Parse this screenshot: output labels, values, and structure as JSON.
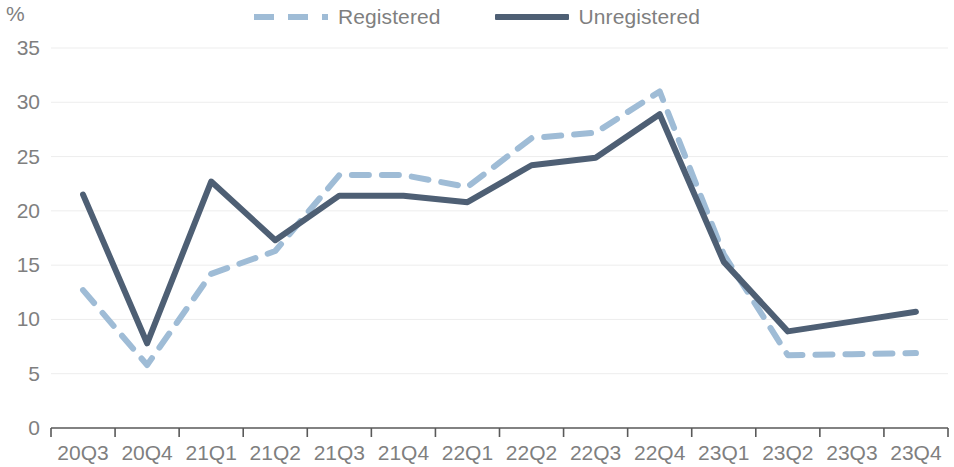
{
  "legend": {
    "entries": [
      {
        "label": "Registered",
        "color": "#9fbcd6",
        "style": "dashed"
      },
      {
        "label": "Unregistered",
        "color": "#4e5f74",
        "style": "solid"
      }
    ]
  },
  "axis": {
    "unit_label": "%",
    "y_ticks": [
      "0",
      "5",
      "10",
      "15",
      "20",
      "25",
      "30",
      "35"
    ],
    "x_ticks": [
      "20Q3",
      "20Q4",
      "21Q1",
      "21Q2",
      "21Q3",
      "21Q4",
      "22Q1",
      "22Q2",
      "22Q3",
      "22Q4",
      "23Q1",
      "23Q2",
      "23Q3",
      "23Q4"
    ]
  },
  "colors": {
    "registered": "#9fbcd6",
    "unregistered": "#4e5f74",
    "gridline": "#ededed",
    "axis": "#595959",
    "text": "#7f7f7f"
  },
  "chart_data": {
    "type": "line",
    "title": "",
    "xlabel": "",
    "ylabel": "%",
    "ylim": [
      0,
      35
    ],
    "yticks": [
      0,
      5,
      10,
      15,
      20,
      25,
      30,
      35
    ],
    "grid": true,
    "legend_position": "top-center",
    "categories": [
      "20Q3",
      "20Q4",
      "21Q1",
      "21Q2",
      "21Q3",
      "21Q4",
      "22Q1",
      "22Q2",
      "22Q3",
      "22Q4",
      "23Q1",
      "23Q2",
      "23Q3",
      "23Q4"
    ],
    "series": [
      {
        "name": "Registered",
        "style": "dashed",
        "color": "#9fbcd6",
        "values": [
          12.7,
          5.8,
          14.2,
          16.3,
          23.3,
          23.3,
          22.2,
          26.7,
          27.2,
          31.0,
          16.0,
          6.7,
          6.8,
          6.9
        ]
      },
      {
        "name": "Unregistered",
        "style": "solid",
        "color": "#4e5f74",
        "values": [
          21.5,
          7.8,
          22.7,
          17.3,
          21.4,
          21.4,
          20.8,
          24.2,
          24.9,
          28.9,
          15.3,
          8.9,
          9.8,
          10.7
        ]
      }
    ]
  }
}
